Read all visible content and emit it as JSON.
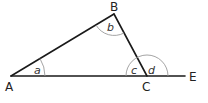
{
  "diagram": {
    "type": "triangle-exterior-angle",
    "points": {
      "A": {
        "label": "A",
        "x": 11,
        "y": 76
      },
      "B": {
        "label": "B",
        "x": 114,
        "y": 14
      },
      "C": {
        "label": "C",
        "x": 147,
        "y": 76
      },
      "E": {
        "label": "E",
        "x": 185,
        "y": 76
      }
    },
    "segments": [
      "AB",
      "BC",
      "AE"
    ],
    "angles": [
      {
        "label": "a",
        "vertex": "A"
      },
      {
        "label": "b",
        "vertex": "B"
      },
      {
        "label": "c",
        "vertex": "C",
        "side": "interior"
      },
      {
        "label": "d",
        "vertex": "C",
        "side": "exterior"
      }
    ],
    "colors": {
      "line": "#1a1a1a",
      "arc": "#9a9a9a",
      "text": "#222222"
    }
  }
}
